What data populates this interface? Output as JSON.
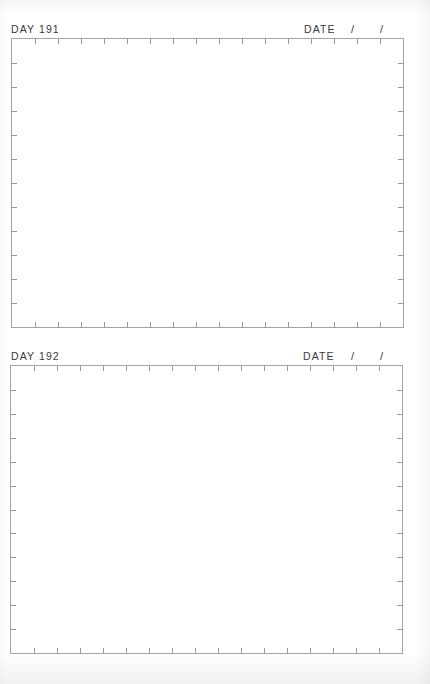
{
  "entries": [
    {
      "day_label": "DAY 191",
      "date_label": "DATE",
      "date_separators": [
        "/",
        "/"
      ],
      "box": {
        "left": 11,
        "top": 38,
        "width": 393,
        "height": 289
      }
    },
    {
      "day_label": "DAY 192",
      "date_label": "DATE",
      "date_separators": [
        "/",
        "/"
      ],
      "box": {
        "left": 10,
        "top": 365,
        "width": 393,
        "height": 288
      }
    }
  ],
  "grid": {
    "horizontal_ticks": 16,
    "vertical_ticks": 11,
    "line_color": "#a4a4a4",
    "text_color": "#3a3a3a"
  }
}
